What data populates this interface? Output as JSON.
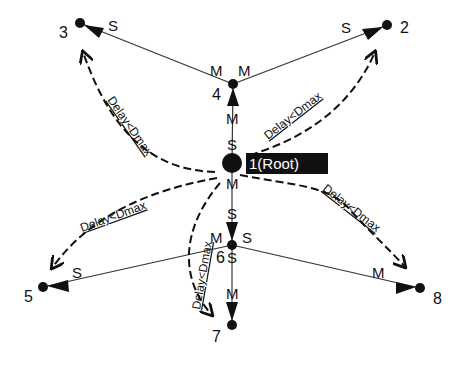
{
  "diagram": {
    "root": {
      "id": "1",
      "label": "1(Root)"
    },
    "nodes": [
      {
        "id": "1",
        "label": "1(Root)"
      },
      {
        "id": "2",
        "label": "2"
      },
      {
        "id": "3",
        "label": "3"
      },
      {
        "id": "4",
        "label": "4"
      },
      {
        "id": "5",
        "label": "5"
      },
      {
        "id": "6",
        "label": "6"
      },
      {
        "id": "7",
        "label": "7"
      },
      {
        "id": "8",
        "label": "8"
      }
    ],
    "links": [
      {
        "from": "4",
        "to": "3",
        "from_role": "M",
        "to_role": "S"
      },
      {
        "from": "4",
        "to": "2",
        "from_role": "M",
        "to_role": "S"
      },
      {
        "from": "1",
        "to": "4",
        "from_role": "S",
        "to_role": "M"
      },
      {
        "from": "1",
        "to": "6",
        "from_role": "M",
        "to_role": "S"
      },
      {
        "from": "6",
        "to": "5",
        "from_role": "M",
        "to_role": "S"
      },
      {
        "from": "6",
        "to": "8",
        "from_role": "S",
        "to_role": "M"
      },
      {
        "from": "6",
        "to": "7",
        "from_role": "S",
        "to_role": "M"
      }
    ],
    "delay_label": "Delay<Dmax",
    "delay_edges": [
      {
        "from": "1",
        "to": "3",
        "label": "Delay<Dmax"
      },
      {
        "from": "1",
        "to": "2",
        "label": "Delay<Dmax"
      },
      {
        "from": "1",
        "to": "5",
        "label": "Delay<Dmax"
      },
      {
        "from": "1",
        "to": "7",
        "label": "Delay<Dmax"
      },
      {
        "from": "1",
        "to": "8",
        "label": "Delay<Dmax"
      }
    ],
    "roles": {
      "master": "M",
      "slave": "S"
    }
  }
}
